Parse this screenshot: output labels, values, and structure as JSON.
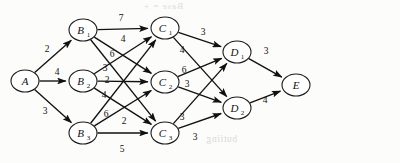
{
  "figure": {
    "background_color": "#fcfcfb",
    "ink_color": "#111111"
  },
  "chart_data": {
    "type": "diagram",
    "subtype": "layered weighted directed graph",
    "title": "",
    "xlabel": "",
    "ylabel": "",
    "grid": false,
    "legend": "none",
    "nodes": [
      {
        "id": "A",
        "base": "A",
        "sub": "",
        "x": 25,
        "y": 81,
        "rx": 14,
        "ry": 11,
        "layer": 0
      },
      {
        "id": "B1",
        "base": "B",
        "sub": "1",
        "x": 83,
        "y": 30,
        "rx": 14,
        "ry": 11,
        "layer": 1
      },
      {
        "id": "B2",
        "base": "B",
        "sub": "2",
        "x": 83,
        "y": 81,
        "rx": 14,
        "ry": 11,
        "layer": 1
      },
      {
        "id": "B3",
        "base": "B",
        "sub": "3",
        "x": 83,
        "y": 133,
        "rx": 14,
        "ry": 11,
        "layer": 1
      },
      {
        "id": "C1",
        "base": "C",
        "sub": "1",
        "x": 165,
        "y": 28,
        "rx": 14,
        "ry": 11,
        "layer": 2
      },
      {
        "id": "C2",
        "base": "C",
        "sub": "2",
        "x": 165,
        "y": 82,
        "rx": 14,
        "ry": 11,
        "layer": 2
      },
      {
        "id": "C3",
        "base": "C",
        "sub": "3",
        "x": 165,
        "y": 133,
        "rx": 14,
        "ry": 11,
        "layer": 2
      },
      {
        "id": "D1",
        "base": "D",
        "sub": "1",
        "x": 237,
        "y": 52,
        "rx": 14,
        "ry": 11,
        "layer": 3
      },
      {
        "id": "D2",
        "base": "D",
        "sub": "2",
        "x": 237,
        "y": 108,
        "rx": 14,
        "ry": 11,
        "layer": 3
      },
      {
        "id": "E",
        "base": "E",
        "sub": "",
        "x": 296,
        "y": 85,
        "rx": 14,
        "ry": 11,
        "layer": 4
      }
    ],
    "edges": [
      {
        "from": "A",
        "to": "B1",
        "weight": 2,
        "lx": 47,
        "ly": 52
      },
      {
        "from": "A",
        "to": "B2",
        "weight": 4,
        "lx": 57,
        "ly": 75
      },
      {
        "from": "A",
        "to": "B3",
        "weight": 3,
        "lx": 45,
        "ly": 114
      },
      {
        "from": "B1",
        "to": "C1",
        "weight": 7,
        "lx": 121,
        "ly": 21
      },
      {
        "from": "B1",
        "to": "C2",
        "weight": 4,
        "lx": 123,
        "ly": 42
      },
      {
        "from": "B1",
        "to": "C3",
        "weight": 6,
        "lx": 112,
        "ly": 57
      },
      {
        "from": "B2",
        "to": "C1",
        "weight": 3,
        "lx": 105,
        "ly": 71
      },
      {
        "from": "B2",
        "to": "C2",
        "weight": 2,
        "lx": 107,
        "ly": 83
      },
      {
        "from": "B2",
        "to": "C3",
        "weight": 4,
        "lx": 104,
        "ly": 98
      },
      {
        "from": "B3",
        "to": "C1",
        "weight": 6,
        "lx": 106,
        "ly": 117
      },
      {
        "from": "B3",
        "to": "C2",
        "weight": 2,
        "lx": 124,
        "ly": 124
      },
      {
        "from": "B3",
        "to": "C3",
        "weight": 5,
        "lx": 122,
        "ly": 152
      },
      {
        "from": "C1",
        "to": "D1",
        "weight": 3,
        "lx": 203,
        "ly": 35
      },
      {
        "from": "C1",
        "to": "D2",
        "weight": 4,
        "lx": 182,
        "ly": 53
      },
      {
        "from": "C2",
        "to": "D1",
        "weight": 6,
        "lx": 184,
        "ly": 73
      },
      {
        "from": "C2",
        "to": "D2",
        "weight": 3,
        "lx": 187,
        "ly": 87
      },
      {
        "from": "C3",
        "to": "D1",
        "weight": 3,
        "lx": 182,
        "ly": 120
      },
      {
        "from": "C3",
        "to": "D2",
        "weight": 3,
        "lx": 195,
        "ly": 140
      },
      {
        "from": "D1",
        "to": "E",
        "weight": 3,
        "lx": 266,
        "ly": 54
      },
      {
        "from": "D2",
        "to": "E",
        "weight": 4,
        "lx": 265,
        "ly": 103
      }
    ]
  },
  "artifacts": {
    "bleed_top": "Base  =  + ",
    "bleed_bottom": "butiing",
    "bleed_bottom2": ""
  }
}
